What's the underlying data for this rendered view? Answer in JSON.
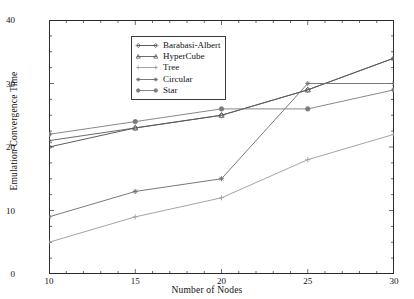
{
  "chart_data": {
    "type": "line",
    "title": "",
    "xlabel": "Number of Nodes",
    "ylabel": "Emulation Convergence Time",
    "x": [
      10,
      15,
      20,
      25,
      30
    ],
    "xlim": [
      10,
      30
    ],
    "ylim": [
      0,
      40
    ],
    "xticks": [
      10,
      15,
      20,
      25,
      30
    ],
    "yticks": [
      0,
      10,
      20,
      30,
      40
    ],
    "xtick_labels": [
      "10",
      "15",
      "20",
      "25",
      "30"
    ],
    "ytick_labels": [
      "0",
      "10",
      "20",
      "30",
      "40"
    ],
    "minor_ticks": true,
    "grid": false,
    "legend_position": "upper-center-left",
    "series": [
      {
        "name": "Barabasi-Albert",
        "color": "#4a4a4a",
        "marker": "diamond",
        "values": [
          20,
          23,
          25,
          29,
          34
        ]
      },
      {
        "name": "HyperCube",
        "color": "#5a5a5a",
        "marker": "triangle",
        "values": [
          21,
          23,
          25,
          29,
          34
        ]
      },
      {
        "name": "Tree",
        "color": "#9a9a9a",
        "marker": "plus",
        "values": [
          5,
          9,
          12,
          18,
          22
        ]
      },
      {
        "name": "Circular",
        "color": "#6a6a6a",
        "marker": "star",
        "values": [
          9,
          13,
          15,
          30,
          30
        ]
      },
      {
        "name": "Star",
        "color": "#7a7a7a",
        "marker": "circle",
        "values": [
          22,
          24,
          26,
          26,
          29
        ]
      }
    ]
  },
  "axes": {
    "x_ticks": [
      "10",
      "15",
      "20",
      "25",
      "30"
    ],
    "y_ticks": [
      "0",
      "10",
      "20",
      "30",
      "40"
    ],
    "x_title": "Number of Nodes",
    "y_title": "Emulation Convergence Time"
  },
  "legend": {
    "entries": [
      "Barabasi-Albert",
      "HyperCube",
      "Tree",
      "Circular",
      "Star"
    ]
  }
}
